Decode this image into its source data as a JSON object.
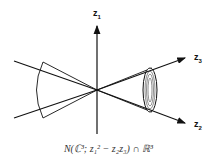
{
  "diagram": {
    "axes": {
      "z1": {
        "label": "z",
        "sub": "1"
      },
      "z2": {
        "label": "z",
        "sub": "2"
      },
      "z3": {
        "label": "z",
        "sub": "3"
      }
    },
    "caption": "N(ℂ³; z₁² − z₂z₃) ∩ ℝ³",
    "colors": {
      "stroke": "#111111",
      "background": "#ffffff"
    }
  }
}
